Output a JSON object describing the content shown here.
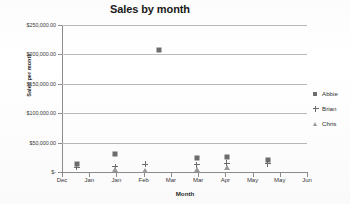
{
  "chart_data": {
    "type": "scatter",
    "title": "Sales by month",
    "xlabel": "Month",
    "ylabel": "Sales per month",
    "grid": true,
    "legend_position": "right",
    "ylim": [
      0,
      250000
    ],
    "ytick_labels": [
      "$250,000.00",
      "$200,000.00",
      "$150,000.00",
      "$100,000.00",
      "$50,000.00",
      "$-"
    ],
    "ytick_values": [
      250000,
      200000,
      150000,
      100000,
      50000,
      0
    ],
    "xtick_labels": [
      "Dec",
      "Jan",
      "Jan",
      "Feb",
      "Mar",
      "Mar",
      "Apr",
      "May",
      "May",
      "Jun"
    ],
    "series": [
      {
        "name": "Abbie",
        "marker": "square",
        "color": "#6d6d6d",
        "points": [
          {
            "x": 0.55,
            "y": 13000
          },
          {
            "x": 1.95,
            "y": 30000
          },
          {
            "x": 3.55,
            "y": 208000
          },
          {
            "x": 4.95,
            "y": 24000
          },
          {
            "x": 6.05,
            "y": 25000
          },
          {
            "x": 7.55,
            "y": 20000
          }
        ]
      },
      {
        "name": "Brian",
        "marker": "plus",
        "color": "#6d6d6d",
        "points": [
          {
            "x": 0.55,
            "y": 8000
          },
          {
            "x": 1.95,
            "y": 9000
          },
          {
            "x": 3.05,
            "y": 13000
          },
          {
            "x": 4.95,
            "y": 12000
          },
          {
            "x": 6.05,
            "y": 15000
          },
          {
            "x": 7.55,
            "y": 14000
          }
        ]
      },
      {
        "name": "Chris",
        "marker": "triangle",
        "color": "#9a9a9a",
        "points": [
          {
            "x": 1.95,
            "y": 4000
          },
          {
            "x": 3.05,
            "y": 2500
          },
          {
            "x": 4.95,
            "y": 4000
          },
          {
            "x": 6.05,
            "y": 7000
          }
        ]
      }
    ]
  },
  "legend": {
    "items": [
      {
        "label": "Abbie",
        "marker": "square-marker-icon"
      },
      {
        "label": "Brian",
        "marker": "plus-marker-icon"
      },
      {
        "label": "Chris",
        "marker": "triangle-marker-icon"
      }
    ]
  }
}
